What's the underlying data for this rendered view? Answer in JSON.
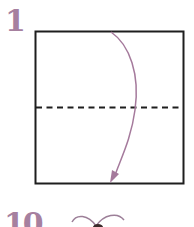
{
  "steps": [
    {
      "number": "1",
      "description": "Square paper folded in half: valley-fold top edge down to bottom edge"
    },
    {
      "number": "10"
    }
  ],
  "colors": {
    "step_number": "#a6809f",
    "arrow": "#a57a9c",
    "outline": "#1e1e1e",
    "fold_line": "#1e1e1e"
  },
  "icons": {
    "fold_arrow": "curved-arrow-down",
    "fold_line": "dashed-valley-fold-line",
    "bow_shape": "bow-outline"
  }
}
